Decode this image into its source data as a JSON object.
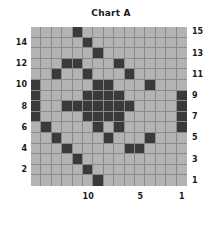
{
  "chart": {
    "title": "Chart A"
  },
  "axes": {
    "y_left_labels": [
      "14",
      "12",
      "10",
      "8",
      "6",
      "4",
      "2"
    ],
    "y_right_labels": [
      "15",
      "13",
      "11",
      "9",
      "7",
      "5",
      "3",
      "1"
    ],
    "x_labels": [
      "10",
      "5",
      "1"
    ]
  },
  "chart_data": {
    "type": "heatmap",
    "title": "Chart A",
    "xlabel": "",
    "ylabel": "",
    "rows": 15,
    "cols": 15,
    "x_direction": "descending",
    "x_values": [
      15,
      14,
      13,
      12,
      11,
      10,
      9,
      8,
      7,
      6,
      5,
      4,
      3,
      2,
      1
    ],
    "y_values": [
      15,
      14,
      13,
      12,
      11,
      10,
      9,
      8,
      7,
      6,
      5,
      4,
      3,
      2,
      1
    ],
    "x_tick_labels": [
      "10",
      "5",
      "1"
    ],
    "x_tick_positions": [
      10,
      5,
      1
    ],
    "y_tick_labels_left": [
      "14",
      "12",
      "10",
      "8",
      "6",
      "4",
      "2"
    ],
    "y_tick_positions_left": [
      14,
      12,
      10,
      8,
      6,
      4,
      2
    ],
    "y_tick_labels_right": [
      "15",
      "13",
      "11",
      "9",
      "7",
      "5",
      "3",
      "1"
    ],
    "y_tick_positions_right": [
      15,
      13,
      11,
      9,
      7,
      5,
      3,
      1
    ],
    "grid": true,
    "colors": {
      "on": "#3a3a3a",
      "off": "#b3b3b3",
      "gridline": "#8a8a8a",
      "background": "#ffffff",
      "text": "#1a1a1a"
    },
    "legend": "none",
    "values": [
      [
        0,
        0,
        0,
        0,
        1,
        0,
        0,
        0,
        0,
        0,
        0,
        0,
        0,
        0,
        0
      ],
      [
        0,
        0,
        0,
        0,
        0,
        1,
        0,
        0,
        0,
        0,
        0,
        0,
        0,
        0,
        0
      ],
      [
        0,
        0,
        0,
        0,
        0,
        0,
        1,
        0,
        0,
        0,
        0,
        0,
        0,
        0,
        0
      ],
      [
        0,
        0,
        0,
        1,
        1,
        0,
        0,
        0,
        1,
        0,
        0,
        0,
        0,
        0,
        0
      ],
      [
        0,
        0,
        1,
        0,
        0,
        1,
        0,
        0,
        0,
        1,
        0,
        0,
        0,
        0,
        0
      ],
      [
        1,
        0,
        0,
        0,
        0,
        0,
        1,
        1,
        0,
        0,
        0,
        1,
        0,
        0,
        0
      ],
      [
        1,
        0,
        0,
        0,
        0,
        1,
        1,
        1,
        1,
        0,
        0,
        0,
        0,
        0,
        1
      ],
      [
        1,
        0,
        0,
        1,
        1,
        1,
        1,
        1,
        1,
        1,
        0,
        0,
        0,
        0,
        1
      ],
      [
        1,
        0,
        0,
        0,
        0,
        1,
        1,
        1,
        1,
        0,
        0,
        0,
        0,
        0,
        1
      ],
      [
        0,
        1,
        0,
        0,
        0,
        0,
        1,
        0,
        1,
        0,
        0,
        0,
        0,
        0,
        1
      ],
      [
        0,
        0,
        1,
        0,
        0,
        0,
        0,
        1,
        0,
        0,
        0,
        1,
        0,
        0,
        0
      ],
      [
        0,
        0,
        0,
        1,
        0,
        0,
        0,
        0,
        0,
        1,
        1,
        0,
        0,
        0,
        0
      ],
      [
        0,
        0,
        0,
        0,
        1,
        0,
        0,
        0,
        0,
        0,
        0,
        0,
        0,
        0,
        0
      ],
      [
        0,
        0,
        0,
        0,
        0,
        1,
        0,
        0,
        0,
        0,
        0,
        0,
        0,
        0,
        0
      ],
      [
        0,
        0,
        0,
        0,
        0,
        0,
        1,
        0,
        0,
        0,
        0,
        0,
        0,
        0,
        0
      ]
    ]
  }
}
